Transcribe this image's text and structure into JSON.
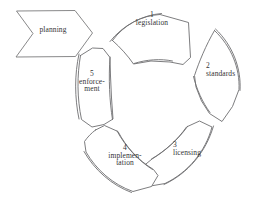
{
  "diagram": {
    "background_color": "#ffffff",
    "stroke_color": "#6e6e70",
    "text_color": "#333335",
    "style": "hand-drawn sketch, thin outline, no fill"
  },
  "planning": {
    "label": "planning",
    "shape": "chevron-arrow",
    "direction": "right"
  },
  "cycle": {
    "direction": "clockwise",
    "segments": [
      {
        "number": "1",
        "name": "legislation",
        "name_line1": "legislation",
        "name_line2": "",
        "position": "top"
      },
      {
        "number": "2",
        "name": "standards",
        "name_line1": "standards",
        "name_line2": "",
        "position": "right"
      },
      {
        "number": "3",
        "name": "licensing",
        "name_line1": "licensing",
        "name_line2": "",
        "position": "bottom-right"
      },
      {
        "number": "4",
        "name": "implementation",
        "name_line1": "implemen-",
        "name_line2": "tation",
        "position": "bottom-left"
      },
      {
        "number": "5",
        "name": "enforcement",
        "name_line1": "enforce-",
        "name_line2": "ment",
        "position": "left"
      }
    ]
  }
}
